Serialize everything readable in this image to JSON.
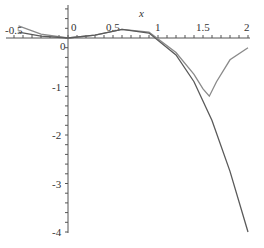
{
  "chart_data": {
    "type": "line",
    "title": "",
    "xlabel": "x",
    "ylabel": "",
    "xlim": [
      -0.6,
      2
    ],
    "ylim": [
      -4,
      0.3
    ],
    "x_ticks": [
      "-0.5",
      "0",
      "0.5",
      "1",
      "1.5",
      "2"
    ],
    "y_ticks": [
      "0",
      "-1",
      "-2",
      "-3",
      "-4"
    ],
    "grid": false,
    "series": [
      {
        "name": "function",
        "color": "#808080",
        "x": [
          -0.55,
          -0.3,
          0,
          0.3,
          0.6,
          0.9,
          1.2,
          1.4,
          1.5,
          1.57,
          1.65,
          1.8,
          2.0
        ],
        "y": [
          0.25,
          0.08,
          0,
          0.06,
          0.18,
          0.12,
          -0.3,
          -0.75,
          -1.05,
          -1.2,
          -0.9,
          -0.45,
          -0.2
        ]
      },
      {
        "name": "approximation",
        "color": "#606060",
        "x": [
          -0.55,
          -0.3,
          0,
          0.3,
          0.6,
          0.9,
          1.2,
          1.4,
          1.6,
          1.8,
          2.0
        ],
        "y": [
          0.12,
          0.04,
          0,
          0.06,
          0.18,
          0.1,
          -0.35,
          -0.9,
          -1.7,
          -2.75,
          -4.0
        ]
      }
    ]
  }
}
